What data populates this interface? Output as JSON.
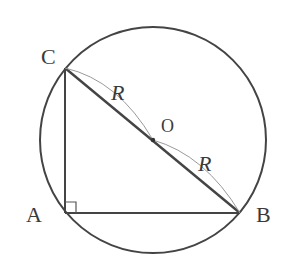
{
  "diagram": {
    "type": "geometry",
    "colors": {
      "stroke": "#444444",
      "thin_arc": "#9a9a9a",
      "label": "#3a3a3a",
      "background": "#ffffff"
    },
    "labels": {
      "C": "C",
      "A": "A",
      "B": "B",
      "O": "O",
      "R_upper": "R",
      "R_lower": "R"
    },
    "points": {
      "O": [
        153,
        140
      ],
      "A": [
        65,
        213
      ],
      "B": [
        240,
        213
      ],
      "C": [
        65,
        68
      ]
    },
    "circle": {
      "cx": 153,
      "cy": 140,
      "r": 113
    },
    "right_angle_at": "A"
  }
}
